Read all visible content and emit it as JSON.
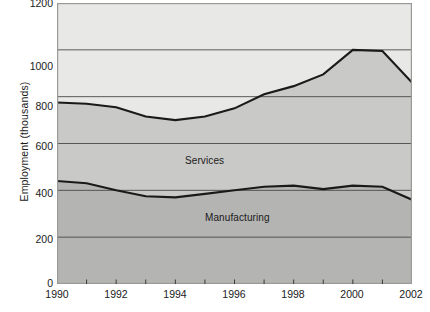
{
  "chart_data": {
    "type": "area",
    "title": "",
    "subtitle": "",
    "xlabel": "",
    "ylabel": "Employment (thousands)",
    "x": [
      1990,
      1991,
      1992,
      1993,
      1994,
      1995,
      1996,
      1997,
      1998,
      1999,
      2000,
      2001,
      2002
    ],
    "xlim": [
      1990,
      2002
    ],
    "ylim": [
      0,
      1200
    ],
    "grid": true,
    "gridlines_y": [
      200,
      400,
      600,
      800,
      1000
    ],
    "legend_position": "in-plot-annotations",
    "stacked": true,
    "series": [
      {
        "name": "Manufacturing",
        "values": [
          440,
          430,
          400,
          375,
          370,
          385,
          400,
          415,
          420,
          405,
          420,
          415,
          360
        ]
      },
      {
        "name": "Services",
        "values": [
          335,
          340,
          355,
          340,
          330,
          330,
          350,
          395,
          425,
          490,
          580,
          580,
          500
        ]
      }
    ],
    "cumulative_total": [
      775,
      770,
      755,
      715,
      700,
      715,
      750,
      810,
      845,
      895,
      1000,
      995,
      860
    ],
    "annotations": [
      {
        "text": "Services",
        "x": 1994.3,
        "y": 630
      },
      {
        "text": "Manufacturing",
        "x": 1995.0,
        "y": 390
      }
    ],
    "y_ticks": [
      {
        "value": 0,
        "label": "0"
      },
      {
        "value": 200,
        "label": "200"
      },
      {
        "value": 400,
        "label": "400"
      },
      {
        "value": 600,
        "label": "600"
      },
      {
        "value": 800,
        "label": "800"
      },
      {
        "value": 1000,
        "label": "1000"
      },
      {
        "value": 1200,
        "label": "1200"
      }
    ],
    "x_ticks": [
      {
        "value": 1990,
        "label": "1990",
        "major": true
      },
      {
        "value": 1991,
        "label": "",
        "major": false
      },
      {
        "value": 1992,
        "label": "1992",
        "major": true
      },
      {
        "value": 1993,
        "label": "",
        "major": false
      },
      {
        "value": 1994,
        "label": "1994",
        "major": true
      },
      {
        "value": 1995,
        "label": "",
        "major": false
      },
      {
        "value": 1996,
        "label": "1996",
        "major": true
      },
      {
        "value": 1997,
        "label": "",
        "major": false
      },
      {
        "value": 1998,
        "label": "1998",
        "major": true
      },
      {
        "value": 1999,
        "label": "",
        "major": false
      },
      {
        "value": 2000,
        "label": "2000",
        "major": true
      },
      {
        "value": 2001,
        "label": "",
        "major": false
      },
      {
        "value": 2002,
        "label": "2002",
        "major": true
      }
    ],
    "colors": {
      "background_band": "#e8e8e6",
      "services_band": "#c9c9c7",
      "manufacturing_band": "#b4b4b2",
      "line": "#1a1a1a",
      "gridline": "#4a4a4a",
      "axis": "#9a9a98",
      "text": "#1a1a1a"
    }
  },
  "yticks": {
    "t0": "0",
    "t200": "200",
    "t400": "400",
    "t600": "600",
    "t800": "800",
    "t1000": "1000",
    "t1200": "1200"
  },
  "xticks": {
    "y1990": "1990",
    "y1992": "1992",
    "y1994": "1994",
    "y1996": "1996",
    "y1998": "1998",
    "y2000": "2000",
    "y2002": "2002"
  },
  "labels": {
    "y_axis_title": "Employment (thousands)",
    "services": "Services",
    "manufacturing": "Manufacturing"
  }
}
